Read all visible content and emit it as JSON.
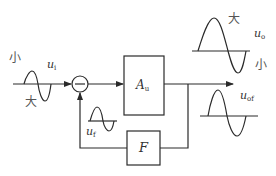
{
  "diagram": {
    "type": "negative-feedback-block-diagram",
    "colors": {
      "line": "#2a2a2a",
      "text": "#333333",
      "background": "#ffffff"
    },
    "input": {
      "label_main": "u",
      "label_sub": "i",
      "note_small": "小",
      "note_large": "大"
    },
    "summing_junction": {
      "sign": "−"
    },
    "amplifier": {
      "label_main": "A",
      "label_sub": "u"
    },
    "feedback_block": {
      "label": "F"
    },
    "feedback_signal": {
      "label_main": "u",
      "label_sub": "f"
    },
    "output_without_feedback": {
      "label_main": "u",
      "label_sub": "o",
      "note_large": "大",
      "note_small": "小"
    },
    "output_with_feedback": {
      "label_main": "u",
      "label_sub": "of"
    }
  }
}
